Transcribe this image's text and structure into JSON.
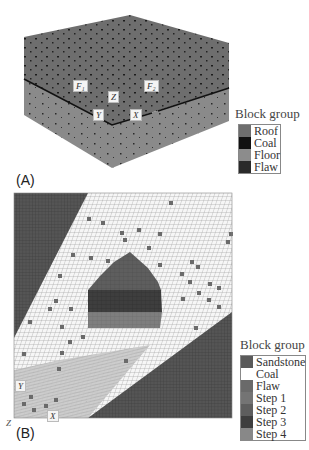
{
  "panel_a": {
    "label": "(A)",
    "axis_labels": {
      "f1": "F₁",
      "f2": "F₂",
      "z": "Z",
      "y": "Y",
      "x": "X"
    },
    "legend": {
      "title": "Block group",
      "items": [
        {
          "label": "Roof",
          "color": "#6e6e6e"
        },
        {
          "label": "Coal",
          "color": "#111111"
        },
        {
          "label": "Floor",
          "color": "#8c8c8c"
        },
        {
          "label": "Flaw",
          "color": "#2a2a2a"
        }
      ]
    }
  },
  "panel_b": {
    "label": "(B)",
    "axis_labels": {
      "y": "Y",
      "x": "X",
      "z": "Z"
    },
    "legend": {
      "title": "Block group",
      "items": [
        {
          "label": "Sandstone",
          "color": "#5a5a5a"
        },
        {
          "label": "Coal",
          "color": "#ffffff"
        },
        {
          "label": "Flaw",
          "color": "#6a6a6a"
        },
        {
          "label": "Step 1",
          "color": "#747474"
        },
        {
          "label": "Step 2",
          "color": "#5e5e5e"
        },
        {
          "label": "Step 3",
          "color": "#3e3e3e"
        },
        {
          "label": "Step 4",
          "color": "#888888"
        }
      ]
    }
  }
}
